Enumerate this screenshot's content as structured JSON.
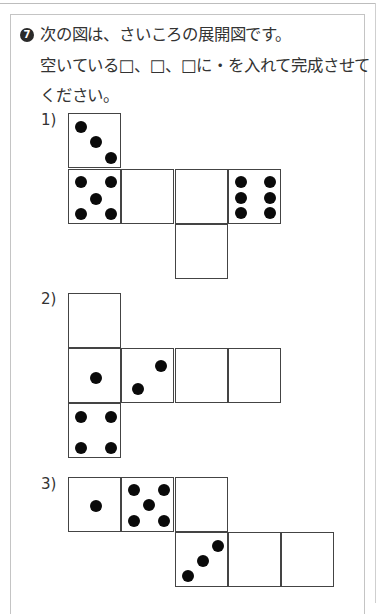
{
  "question": {
    "number": "7",
    "text_lines": [
      "次の図は、さいころの展開図です。",
      "空いている□、□、□に・を入れて完成させて",
      "ください。"
    ]
  },
  "nets": [
    {
      "label": "1)",
      "label_top": 112,
      "cells": [
        {
          "x": 68,
          "y": 113,
          "pips": 3,
          "dots": [
            [
              12,
              13
            ],
            [
              27,
              28
            ],
            [
              42,
              44
            ]
          ]
        },
        {
          "x": 68,
          "y": 169,
          "pips": 5,
          "dots": [
            [
              12,
              12
            ],
            [
              42,
              12
            ],
            [
              27,
              29
            ],
            [
              12,
              44
            ],
            [
              42,
              44
            ]
          ]
        },
        {
          "x": 121,
          "y": 169,
          "pips": 0,
          "dots": []
        },
        {
          "x": 175,
          "y": 169,
          "pips": 0,
          "dots": []
        },
        {
          "x": 228,
          "y": 169,
          "pips": 6,
          "dots": [
            [
              12,
              12
            ],
            [
              41,
              12
            ],
            [
              12,
              28
            ],
            [
              41,
              28
            ],
            [
              12,
              43
            ],
            [
              41,
              43
            ]
          ]
        },
        {
          "x": 175,
          "y": 224,
          "pips": 0,
          "dots": []
        }
      ]
    },
    {
      "label": "2)",
      "label_top": 291,
      "cells": [
        {
          "x": 68,
          "y": 293,
          "pips": 0,
          "dots": []
        },
        {
          "x": 68,
          "y": 348,
          "pips": 1,
          "dots": [
            [
              27,
              29
            ]
          ]
        },
        {
          "x": 121,
          "y": 348,
          "pips": 2,
          "dots": [
            [
              16,
              40
            ],
            [
              39,
              17
            ]
          ]
        },
        {
          "x": 175,
          "y": 348,
          "pips": 0,
          "dots": []
        },
        {
          "x": 228,
          "y": 348,
          "pips": 0,
          "dots": []
        },
        {
          "x": 68,
          "y": 403,
          "pips": 4,
          "dots": [
            [
              12,
              13
            ],
            [
              42,
              13
            ],
            [
              12,
              44
            ],
            [
              42,
              44
            ]
          ]
        }
      ]
    },
    {
      "label": "3)",
      "label_top": 476,
      "cells": [
        {
          "x": 68,
          "y": 477,
          "pips": 1,
          "dots": [
            [
              27,
              28
            ]
          ]
        },
        {
          "x": 121,
          "y": 477,
          "pips": 5,
          "dots": [
            [
              12,
              12
            ],
            [
              42,
              12
            ],
            [
              27,
              27
            ],
            [
              12,
              43
            ],
            [
              42,
              43
            ]
          ]
        },
        {
          "x": 175,
          "y": 477,
          "pips": 0,
          "dots": []
        },
        {
          "x": 175,
          "y": 532,
          "pips": 3,
          "dots": [
            [
              12,
              43
            ],
            [
              27,
              28
            ],
            [
              42,
              13
            ]
          ]
        },
        {
          "x": 228,
          "y": 532,
          "pips": 0,
          "dots": []
        },
        {
          "x": 281,
          "y": 532,
          "pips": 0,
          "dots": []
        }
      ]
    }
  ]
}
